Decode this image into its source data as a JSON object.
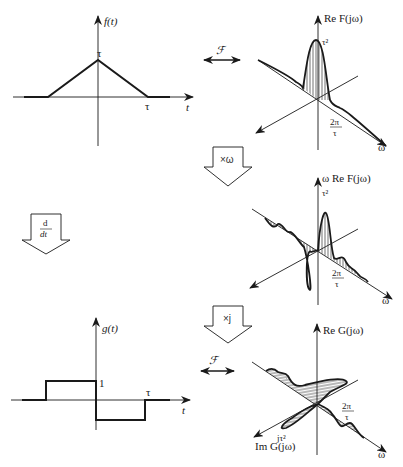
{
  "figure": {
    "plots": {
      "f_t": {
        "ylabel": "f(t)",
        "xlabel": "t",
        "peak_label": "τ",
        "x_tick": "τ",
        "description": "Triangular pulse, height τ, extending from -τ to τ"
      },
      "re_F": {
        "zlabel": "Re F(jω)",
        "xlabel": "ω",
        "peak_label": "τ²",
        "zero_label_num": "2π",
        "zero_label_den": "τ",
        "description": "sinc² shaped real spectrum"
      },
      "omega_re_F": {
        "zlabel": "ω Re F(jω)",
        "xlabel": "ω",
        "peak_label": "τ²",
        "zero_label_num": "2π",
        "zero_label_den": "τ",
        "description": "Odd oscillating real function ω·Re F(jω)"
      },
      "g_t": {
        "ylabel": "g(t)",
        "xlabel": "t",
        "level_label": "1",
        "x_tick": "τ",
        "description": "Derivative of triangle: +1 on (-τ,0), -1 on (0,τ)"
      },
      "G": {
        "zlabel": "Re G(jω)",
        "ylabel": "Im G(jω)",
        "xlabel": "ω",
        "imag_label": "jτ²",
        "zero_label_num": "2π",
        "zero_label_den": "τ",
        "description": "Purely imaginary spectrum G(jω)"
      }
    },
    "operations": {
      "fourier_top": "ℱ",
      "fourier_bottom": "ℱ",
      "times_omega": "×ω",
      "times_j": "×j",
      "derivative_num": "d",
      "derivative_den": "dt"
    }
  }
}
